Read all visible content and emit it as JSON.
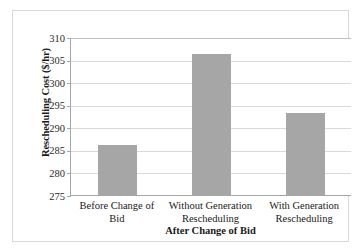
{
  "chart_data": {
    "type": "bar",
    "title": "",
    "xlabel": "After Change of Bid",
    "ylabel": "Rescheduling Cost ($/hr)",
    "categories": [
      "Before Change of Bid",
      "Without Generation Rescheduling",
      "With Generation Rescheduling"
    ],
    "category_lines": [
      [
        "Before Change of Bid"
      ],
      [
        "Without Generation",
        "Rescheduling"
      ],
      [
        "With Generation",
        "Rescheduling"
      ]
    ],
    "values": [
      286.0,
      306.2,
      293.2
    ],
    "ylim": [
      275,
      310
    ],
    "ytick_labels": [
      "310",
      "305",
      "300",
      "295",
      "290",
      "285",
      "280",
      "275"
    ],
    "ytick_values": [
      310,
      305,
      300,
      295,
      290,
      285,
      280,
      275
    ],
    "grid": "horizontal",
    "legend": "none",
    "bar_color": "#a6a6a6",
    "gridline_color": "#d9d9d9",
    "axis_color": "#a6a6a6",
    "frame_color": "#d9d9d9",
    "background": "#ffffff"
  }
}
